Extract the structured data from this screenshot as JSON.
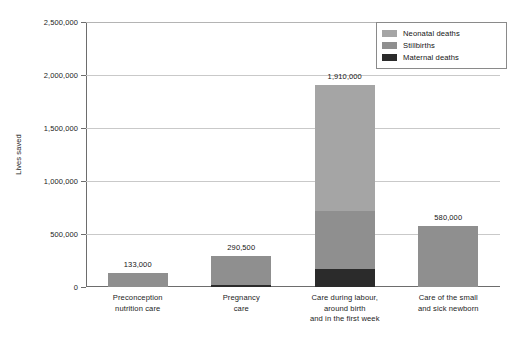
{
  "chart_data": {
    "type": "bar",
    "subtype": "stacked-bar",
    "title": "",
    "xlabel": "",
    "ylabel": "Lives saved",
    "ylim": [
      0,
      2500000
    ],
    "ytick_step": 500000,
    "grid": true,
    "legend_position": "top-right",
    "categories": [
      "Preconception\nnutrition care",
      "Pregnancy\ncare",
      "Care during labour,\naround birth\nand in the first week",
      "Care of the small\nand sick newborn"
    ],
    "category_lines": [
      [
        "Preconception",
        "nutrition care"
      ],
      [
        "Pregnancy",
        "care"
      ],
      [
        "Care during labour,",
        "around birth",
        "and in the first week"
      ],
      [
        "Care of the small",
        "and sick newborn"
      ]
    ],
    "series": [
      {
        "name": "Maternal deaths",
        "color": "#2b2b2b",
        "values": [
          0,
          15000,
          170000,
          0
        ]
      },
      {
        "name": "Stillbirths",
        "color": "#8f8f8f",
        "values": [
          133000,
          275500,
          550000,
          580000
        ]
      },
      {
        "name": "Neonatal deaths",
        "color": "#a5a5a5",
        "values": [
          0,
          0,
          1190000,
          0
        ]
      }
    ],
    "totals": [
      133000,
      290500,
      1910000,
      580000
    ],
    "total_labels": [
      "133,000",
      "290,500",
      "1,910,000",
      "580,000"
    ],
    "ytick_labels": [
      "0",
      "500,000",
      "1,000,000",
      "1,500,000",
      "2,000,000",
      "2,500,000"
    ],
    "ytick_values": [
      0,
      500000,
      1000000,
      1500000,
      2000000,
      2500000
    ]
  },
  "legend": {
    "items": [
      {
        "label": "Neonatal deaths",
        "color": "#a5a5a5"
      },
      {
        "label": "Stillbirths",
        "color": "#8f8f8f"
      },
      {
        "label": "Maternal deaths",
        "color": "#2b2b2b"
      }
    ]
  },
  "axis": {
    "y_title": "Lives saved"
  }
}
